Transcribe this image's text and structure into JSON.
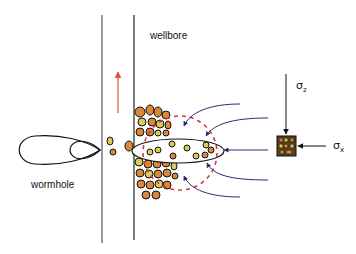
{
  "labels": {
    "wellbore": "wellbore",
    "wormhole": "wormhole",
    "sigma_z": "σ",
    "sigma_z_sub": "z",
    "sigma_x": "σ",
    "sigma_x_sub": "x"
  },
  "colors": {
    "wellbore_line": "#444444",
    "flow_arrow": "#e0533c",
    "dashed_circle": "#d0344a",
    "stream_lines": "#2b2a6b",
    "sand_orange": "#d9873a",
    "sand_yellow": "#d8cc55",
    "outline": "#111111"
  }
}
